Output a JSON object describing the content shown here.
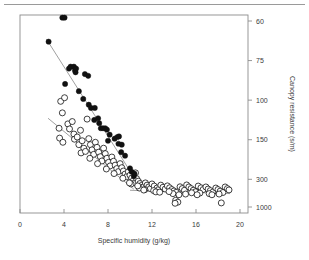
{
  "figure": {
    "has_top_rule": true,
    "background_color": "#ffffff",
    "frame_color": "#8c8c8c",
    "marker_color": "#111111",
    "line_color": "#8f8f8f"
  },
  "chart_data": {
    "type": "scatter",
    "title": "",
    "subtitle": "",
    "xlabel": "Specific humidity (g/kg)",
    "ylabel": "Canopy resistance (s/m)",
    "grid": false,
    "legend_position": "none",
    "x_axis": {
      "label": "Specific humidity (g/kg)",
      "ticks": [
        0,
        4,
        8,
        12,
        16,
        20
      ],
      "tick_labels": [
        "0",
        "4",
        "8",
        "12",
        "16",
        "20"
      ],
      "xlim": [
        0,
        20
      ],
      "scale": "linear",
      "position": "bottom"
    },
    "y_axis": {
      "label": "Canopy resistance (s/m)",
      "ticks": [
        60,
        75,
        100,
        150,
        300,
        1000
      ],
      "tick_labels": [
        "60",
        "75",
        "100",
        "150",
        "300",
        "1000"
      ],
      "ylim": [
        55,
        1500
      ],
      "scale": "reciprocal",
      "position": "right",
      "direction": "increasing-downward"
    },
    "annotations": [],
    "series": [
      {
        "name": "filled-circles",
        "marker": "filled-circle",
        "marker_size": 2.6,
        "points": [
          [
            2.6,
            67
          ],
          [
            3.85,
            59
          ],
          [
            4.05,
            59
          ],
          [
            4.1,
            88
          ],
          [
            4.45,
            79
          ],
          [
            4.6,
            78
          ],
          [
            4.9,
            78
          ],
          [
            5.0,
            80
          ],
          [
            5.05,
            81
          ],
          [
            5.1,
            79
          ],
          [
            5.35,
            93
          ],
          [
            5.9,
            82
          ],
          [
            6.2,
            83
          ],
          [
            5.75,
            99
          ],
          [
            6.25,
            104
          ],
          [
            6.45,
            107
          ],
          [
            6.8,
            107
          ],
          [
            6.75,
            120
          ],
          [
            7.1,
            118
          ],
          [
            7.2,
            124
          ],
          [
            7.35,
            131
          ],
          [
            7.55,
            131
          ],
          [
            7.75,
            131
          ],
          [
            7.9,
            133
          ],
          [
            8.15,
            141
          ],
          [
            8.0,
            152
          ],
          [
            8.6,
            148
          ],
          [
            8.85,
            145
          ],
          [
            9.0,
            144
          ],
          [
            8.95,
            158
          ],
          [
            9.25,
            160
          ],
          [
            9.2,
            178
          ],
          [
            9.55,
            188
          ],
          [
            10.0,
            235
          ],
          [
            10.15,
            252
          ],
          [
            10.35,
            278
          ],
          [
            10.4,
            262
          ]
        ]
      },
      {
        "name": "open-circles",
        "marker": "open-circle",
        "marker_size": 3.0,
        "points": [
          [
            3.7,
            101
          ],
          [
            3.85,
            112
          ],
          [
            4.05,
            98
          ],
          [
            3.55,
            131
          ],
          [
            3.6,
            147
          ],
          [
            3.9,
            155
          ],
          [
            4.35,
            125
          ],
          [
            4.5,
            132
          ],
          [
            4.75,
            122
          ],
          [
            4.9,
            140
          ],
          [
            4.95,
            149
          ],
          [
            5.2,
            145
          ],
          [
            5.35,
            160
          ],
          [
            5.5,
            134
          ],
          [
            5.65,
            152
          ],
          [
            5.8,
            168
          ],
          [
            5.55,
            180
          ],
          [
            5.95,
            176
          ],
          [
            6.1,
            119
          ],
          [
            6.25,
            148
          ],
          [
            6.4,
            160
          ],
          [
            6.55,
            172
          ],
          [
            6.7,
            184
          ],
          [
            6.35,
            196
          ],
          [
            6.85,
            155
          ],
          [
            7.0,
            166
          ],
          [
            7.15,
            178
          ],
          [
            7.3,
            191
          ],
          [
            7.45,
            205
          ],
          [
            7.05,
            215
          ],
          [
            7.6,
            168
          ],
          [
            7.75,
            182
          ],
          [
            7.9,
            196
          ],
          [
            8.05,
            210
          ],
          [
            8.2,
            224
          ],
          [
            7.85,
            238
          ],
          [
            8.35,
            192
          ],
          [
            8.5,
            206
          ],
          [
            8.65,
            221
          ],
          [
            8.8,
            236
          ],
          [
            8.95,
            251
          ],
          [
            8.55,
            262
          ],
          [
            9.1,
            215
          ],
          [
            9.25,
            232
          ],
          [
            9.4,
            248
          ],
          [
            9.55,
            265
          ],
          [
            9.7,
            281
          ],
          [
            9.35,
            292
          ],
          [
            9.85,
            252
          ],
          [
            10.0,
            272
          ],
          [
            10.15,
            291
          ],
          [
            10.3,
            310
          ],
          [
            10.45,
            328
          ],
          [
            10.1,
            340
          ],
          [
            10.6,
            295
          ],
          [
            10.75,
            315
          ],
          [
            10.9,
            336
          ],
          [
            11.05,
            355
          ],
          [
            11.2,
            372
          ],
          [
            10.85,
            385
          ],
          [
            11.4,
            330
          ],
          [
            11.55,
            352
          ],
          [
            11.7,
            372
          ],
          [
            11.85,
            392
          ],
          [
            11.35,
            405
          ],
          [
            10.5,
            258
          ],
          [
            12.0,
            340
          ],
          [
            12.2,
            362
          ],
          [
            12.45,
            385
          ],
          [
            12.6,
            405
          ],
          [
            12.15,
            420
          ],
          [
            12.8,
            352
          ],
          [
            13.0,
            375
          ],
          [
            13.2,
            398
          ],
          [
            12.35,
            440
          ],
          [
            13.4,
            360
          ],
          [
            13.6,
            382
          ],
          [
            13.8,
            405
          ],
          [
            14.0,
            425
          ],
          [
            14.2,
            448
          ],
          [
            13.9,
            470
          ],
          [
            14.15,
            640
          ],
          [
            14.35,
            710
          ],
          [
            14.1,
            760
          ],
          [
            14.55,
            370
          ],
          [
            14.75,
            392
          ],
          [
            14.95,
            415
          ],
          [
            15.15,
            350
          ],
          [
            15.35,
            372
          ],
          [
            15.55,
            392
          ],
          [
            15.75,
            415
          ],
          [
            15.95,
            438
          ],
          [
            15.6,
            455
          ],
          [
            16.2,
            362
          ],
          [
            16.45,
            382
          ],
          [
            16.65,
            405
          ],
          [
            16.35,
            460
          ],
          [
            16.9,
            372
          ],
          [
            17.1,
            398
          ],
          [
            17.3,
            420
          ],
          [
            17.55,
            440
          ],
          [
            17.2,
            470
          ],
          [
            17.8,
            385
          ],
          [
            18.0,
            405
          ],
          [
            18.2,
            428
          ],
          [
            18.45,
            450
          ],
          [
            18.1,
            478
          ],
          [
            18.3,
            745
          ],
          [
            18.65,
            372
          ],
          [
            18.85,
            392
          ],
          [
            19.0,
            410
          ],
          [
            11.25,
            412
          ],
          [
            12.7,
            445
          ],
          [
            13.55,
            435
          ],
          [
            15.05,
            478
          ],
          [
            16.1,
            492
          ],
          [
            17.45,
            492
          ],
          [
            14.45,
            492
          ],
          [
            10.7,
            360
          ],
          [
            9.95,
            330
          ]
        ]
      }
    ],
    "trend_lines": [
      {
        "name": "filled-series-fit",
        "series": "filled-circles",
        "x_start": 2.4,
        "y_start": 66,
        "x_end": 10.4,
        "y_end": 290
      },
      {
        "name": "open-series-fit-sloped",
        "series": "open-circles",
        "x_start": 2.55,
        "y_start": 118,
        "x_end": 10.35,
        "y_end": 400
      },
      {
        "name": "open-series-fit-flat",
        "series": "open-circles",
        "x_start": 10.0,
        "y_start": 415,
        "x_end": 19.1,
        "y_end": 470
      }
    ]
  }
}
